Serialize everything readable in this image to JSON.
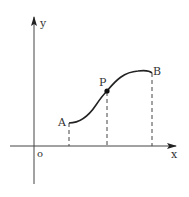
{
  "diagram": {
    "type": "function-curve",
    "axes": {
      "x_label": "x",
      "y_label": "y",
      "origin_label": "o"
    },
    "points": [
      {
        "label": "A",
        "role": "start",
        "filled": false
      },
      {
        "label": "P",
        "role": "intermediate",
        "filled": true
      },
      {
        "label": "B",
        "role": "end",
        "filled": false
      }
    ],
    "projections": "dashed vertical lines from A, P, B down to x-axis",
    "colors": {
      "stroke": "#222222",
      "background": "#ffffff"
    }
  }
}
